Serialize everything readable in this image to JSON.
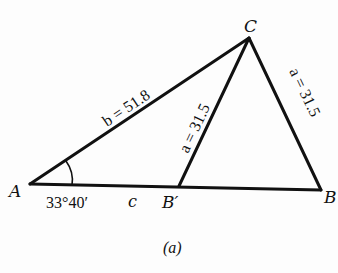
{
  "figure": {
    "caption": "(a)",
    "vertices": {
      "A": "A",
      "B": "B",
      "B_prime": "B′",
      "C": "C"
    },
    "sides": {
      "b": "b = 51.8",
      "a_left": "a = 31.5",
      "a_right": "a = 31.5",
      "c": "c"
    },
    "angle_A": "33°40′"
  }
}
